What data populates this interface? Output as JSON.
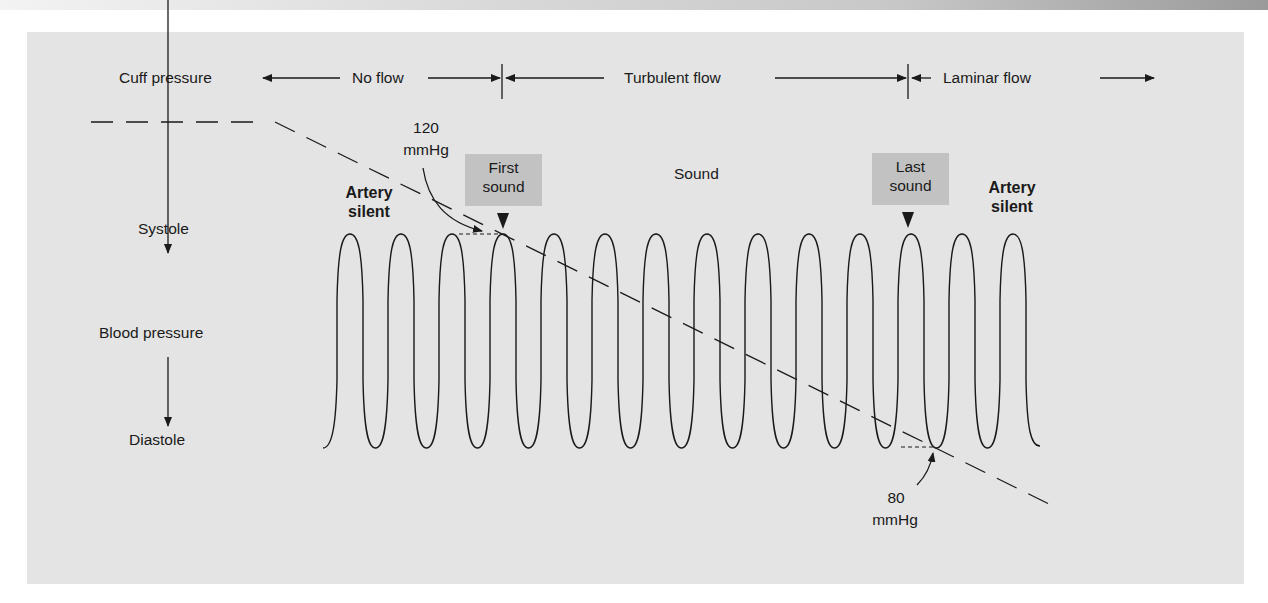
{
  "figure": {
    "header_row": {
      "cuff_pressure": "Cuff pressure",
      "no_flow": "No flow",
      "turbulent_flow": "Turbulent flow",
      "laminar_flow": "Laminar flow"
    },
    "left_axis": {
      "top": "Systole",
      "middle": "Blood pressure",
      "bottom": "Diastole"
    },
    "annotations": {
      "systolic_value": "120",
      "systolic_unit": "mmHg",
      "diastolic_value": "80",
      "diastolic_unit": "mmHg",
      "artery_silent_left_1": "Artery",
      "artery_silent_left_2": "silent",
      "artery_silent_right_1": "Artery",
      "artery_silent_right_2": "silent",
      "first_sound_1": "First",
      "first_sound_2": "sound",
      "last_sound_1": "Last",
      "last_sound_2": "sound",
      "sound": "Sound"
    },
    "colors": {
      "panel_bg": "#e4e4e4",
      "callout_bg": "#c2c2c2",
      "ink": "#1a1a1a"
    },
    "wave": {
      "pulse_count": 14,
      "first_peak_x": 350,
      "period_px": 51,
      "peak_y": 234,
      "trough_y": 447
    }
  }
}
